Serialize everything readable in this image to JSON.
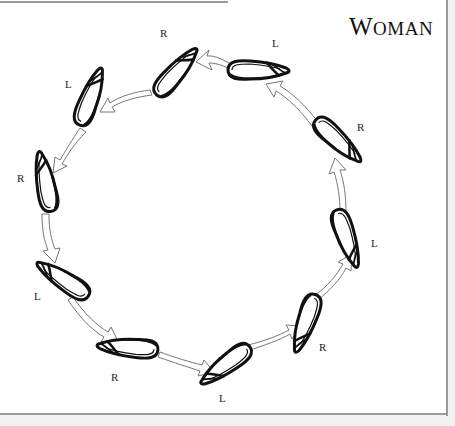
{
  "title": {
    "first": "W",
    "rest": "OMAN",
    "full": "Woman"
  },
  "steps": [
    {
      "foot": "R",
      "label_x": 160,
      "label_y": 27
    },
    {
      "foot": "L",
      "label_x": 272,
      "label_y": 37
    },
    {
      "foot": "R",
      "label_x": 357,
      "label_y": 121
    },
    {
      "foot": "L",
      "label_x": 371,
      "label_y": 237
    },
    {
      "foot": "R",
      "label_x": 319,
      "label_y": 341
    },
    {
      "foot": "L",
      "label_x": 219,
      "label_y": 392
    },
    {
      "foot": "R",
      "label_x": 111,
      "label_y": 371
    },
    {
      "foot": "L",
      "label_x": 34,
      "label_y": 290
    },
    {
      "foot": "R",
      "label_x": 17,
      "label_y": 172
    },
    {
      "foot": "L",
      "label_x": 65,
      "label_y": 78
    }
  ],
  "colors": {
    "ink": "#111111",
    "frame": "#9a9a9a",
    "arrow_stroke": "#777777"
  }
}
